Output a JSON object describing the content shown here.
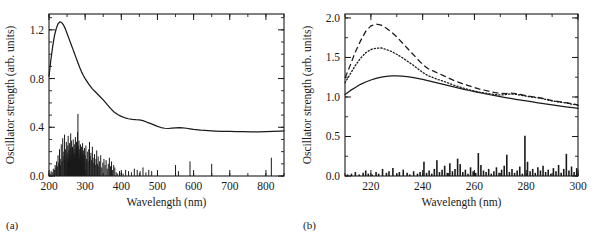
{
  "figure": {
    "panel_a_label": "(a)",
    "panel_b_label": "(b)"
  },
  "chart_data": [
    {
      "type": "line",
      "panel": "(a)",
      "title": "",
      "xlabel": "Wavelength (nm)",
      "ylabel": "Oscillator strength (arb. units)",
      "xlim": [
        200,
        850
      ],
      "ylim": [
        0.0,
        1.33
      ],
      "xticks": [
        200,
        300,
        400,
        500,
        600,
        700,
        800
      ],
      "xtick_labels": [
        "200",
        "300",
        "400",
        "500",
        "600",
        "700",
        "800"
      ],
      "yticks": [
        0.0,
        0.4,
        0.8,
        1.2
      ],
      "ytick_labels": [
        "0.0",
        "0.4",
        "0.8",
        "1.2"
      ],
      "minor_xtick_interval": 50,
      "minor_ytick_interval": 0.1,
      "grid": false,
      "legend": "none",
      "series": [
        {
          "name": "broadened spectrum",
          "style": "solid",
          "x": [
            200,
            205,
            210,
            215,
            220,
            225,
            230,
            235,
            240,
            245,
            250,
            255,
            260,
            265,
            270,
            275,
            280,
            285,
            290,
            295,
            300,
            310,
            320,
            330,
            340,
            350,
            360,
            370,
            380,
            390,
            400,
            410,
            420,
            430,
            440,
            450,
            460,
            470,
            480,
            490,
            500,
            510,
            520,
            530,
            540,
            550,
            560,
            570,
            580,
            590,
            600,
            620,
            640,
            660,
            680,
            700,
            720,
            740,
            760,
            780,
            800,
            820,
            840,
            850
          ],
          "y": [
            0.82,
            0.95,
            1.06,
            1.15,
            1.21,
            1.25,
            1.265,
            1.26,
            1.24,
            1.21,
            1.17,
            1.13,
            1.09,
            1.05,
            1.01,
            0.97,
            0.93,
            0.89,
            0.855,
            0.825,
            0.8,
            0.755,
            0.715,
            0.685,
            0.655,
            0.625,
            0.59,
            0.555,
            0.525,
            0.505,
            0.49,
            0.478,
            0.47,
            0.465,
            0.462,
            0.461,
            0.455,
            0.443,
            0.432,
            0.42,
            0.408,
            0.398,
            0.392,
            0.39,
            0.393,
            0.396,
            0.398,
            0.396,
            0.392,
            0.387,
            0.382,
            0.376,
            0.372,
            0.369,
            0.367,
            0.366,
            0.365,
            0.364,
            0.363,
            0.363,
            0.364,
            0.366,
            0.369,
            0.371
          ]
        }
      ],
      "stick_spectrum": {
        "name": "oscillator strength transitions",
        "x": [
          203,
          206,
          209,
          212,
          215,
          217,
          219,
          221,
          223,
          225,
          227,
          229,
          231,
          232,
          234,
          236,
          238,
          239,
          241,
          243,
          244,
          246,
          247,
          248,
          250,
          251,
          252,
          253,
          254,
          255,
          256,
          257,
          258,
          259,
          260,
          261,
          262,
          263,
          264,
          265,
          266,
          267,
          268,
          269,
          270,
          271,
          272,
          273,
          274,
          275,
          276,
          277,
          278,
          279,
          280,
          281,
          282,
          283,
          284,
          285,
          286,
          287,
          288,
          289,
          290,
          291,
          292,
          293,
          294,
          295,
          296,
          297,
          298,
          299,
          300,
          302,
          304,
          306,
          308,
          310,
          312,
          314,
          316,
          318,
          320,
          322,
          324,
          326,
          328,
          330,
          332,
          334,
          336,
          338,
          340,
          343,
          346,
          349,
          352,
          355,
          358,
          361,
          364,
          367,
          370,
          373,
          376,
          379,
          382,
          386,
          390,
          395,
          400,
          405,
          412,
          420,
          428,
          436,
          444,
          452,
          460,
          468,
          476,
          484,
          550,
          558,
          590,
          650,
          815
        ],
        "y": [
          0.02,
          0.04,
          0.03,
          0.06,
          0.05,
          0.09,
          0.07,
          0.12,
          0.08,
          0.17,
          0.11,
          0.22,
          0.14,
          0.09,
          0.26,
          0.12,
          0.31,
          0.16,
          0.2,
          0.34,
          0.13,
          0.22,
          0.16,
          0.28,
          0.19,
          0.12,
          0.25,
          0.33,
          0.15,
          0.21,
          0.18,
          0.27,
          0.14,
          0.23,
          0.35,
          0.17,
          0.29,
          0.13,
          0.2,
          0.24,
          0.16,
          0.3,
          0.18,
          0.22,
          0.26,
          0.14,
          0.19,
          0.32,
          0.17,
          0.23,
          0.28,
          0.15,
          0.21,
          0.36,
          0.51,
          0.25,
          0.18,
          0.29,
          0.14,
          0.22,
          0.17,
          0.26,
          0.13,
          0.2,
          0.24,
          0.16,
          0.19,
          0.27,
          0.12,
          0.21,
          0.15,
          0.18,
          0.23,
          0.11,
          0.17,
          0.25,
          0.14,
          0.2,
          0.12,
          0.22,
          0.28,
          0.16,
          0.19,
          0.13,
          0.24,
          0.15,
          0.11,
          0.18,
          0.09,
          0.14,
          0.21,
          0.1,
          0.16,
          0.08,
          0.12,
          0.17,
          0.07,
          0.11,
          0.14,
          0.09,
          0.13,
          0.06,
          0.1,
          0.15,
          0.08,
          0.12,
          0.05,
          0.09,
          0.07,
          0.03,
          0.02,
          0.04,
          0.03,
          0.02,
          0.05,
          0.04,
          0.03,
          0.06,
          0.05,
          0.04,
          0.07,
          0.03,
          0.05,
          0.04,
          0.09,
          0.04,
          0.12,
          0.1,
          0.15
        ]
      }
    },
    {
      "type": "line",
      "panel": "(b)",
      "title": "",
      "xlabel": "Wavelength (nm)",
      "ylabel": "Oscillator strength (arb. units)",
      "xlim": [
        210,
        300
      ],
      "ylim": [
        0.0,
        2.05
      ],
      "xticks": [
        220,
        240,
        260,
        280,
        300
      ],
      "xtick_labels": [
        "220",
        "240",
        "260",
        "280",
        "300"
      ],
      "yticks": [
        0.0,
        0.5,
        1.0,
        1.5,
        2.0
      ],
      "ytick_labels": [
        "0.0",
        "0.5",
        "1.0",
        "1.5",
        "2.0"
      ],
      "minor_xtick_interval": 10,
      "minor_ytick_interval": 0.25,
      "grid": false,
      "legend": "none",
      "series": [
        {
          "name": "dashed spectrum",
          "style": "dashed",
          "x": [
            210,
            212,
            214,
            216,
            218,
            220,
            222,
            224,
            226,
            228,
            230,
            232,
            234,
            236,
            238,
            240,
            242,
            244,
            246,
            248,
            250,
            252,
            254,
            256,
            258,
            260,
            262,
            264,
            266,
            268,
            270,
            272,
            274,
            276,
            278,
            280,
            282,
            284,
            286,
            288,
            290,
            292,
            294,
            296,
            298,
            300
          ],
          "y": [
            1.24,
            1.4,
            1.57,
            1.71,
            1.83,
            1.9,
            1.922,
            1.91,
            1.87,
            1.82,
            1.76,
            1.69,
            1.62,
            1.55,
            1.48,
            1.41,
            1.36,
            1.33,
            1.3,
            1.27,
            1.24,
            1.21,
            1.185,
            1.16,
            1.14,
            1.12,
            1.1,
            1.085,
            1.07,
            1.055,
            1.045,
            1.042,
            1.048,
            1.044,
            1.03,
            1.015,
            1.005,
            1.0,
            0.985,
            0.97,
            0.955,
            0.945,
            0.935,
            0.925,
            0.912,
            0.9
          ]
        },
        {
          "name": "dotted spectrum",
          "style": "dotted",
          "x": [
            210,
            212,
            214,
            216,
            218,
            220,
            222,
            224,
            226,
            228,
            230,
            232,
            234,
            236,
            238,
            240,
            242,
            244,
            246,
            248,
            250,
            252,
            254,
            256,
            258,
            260,
            262,
            264,
            266,
            268,
            270,
            272,
            274,
            276,
            278,
            280,
            282,
            284,
            286,
            288,
            290,
            292,
            294,
            296,
            298,
            300
          ],
          "y": [
            1.18,
            1.29,
            1.4,
            1.49,
            1.56,
            1.6,
            1.617,
            1.62,
            1.6,
            1.575,
            1.54,
            1.5,
            1.455,
            1.41,
            1.36,
            1.31,
            1.27,
            1.245,
            1.22,
            1.2,
            1.175,
            1.15,
            1.13,
            1.11,
            1.09,
            1.075,
            1.06,
            1.05,
            1.04,
            1.03,
            1.025,
            1.03,
            1.038,
            1.034,
            1.022,
            1.01,
            1.0,
            0.992,
            0.98,
            0.965,
            0.95,
            0.94,
            0.93,
            0.92,
            0.908,
            0.895
          ]
        },
        {
          "name": "solid spectrum",
          "style": "solid",
          "x": [
            210,
            212,
            214,
            216,
            218,
            220,
            222,
            224,
            226,
            228,
            230,
            232,
            234,
            236,
            238,
            240,
            242,
            244,
            246,
            248,
            250,
            252,
            254,
            256,
            258,
            260,
            262,
            264,
            266,
            268,
            270,
            272,
            274,
            276,
            278,
            280,
            282,
            284,
            286,
            288,
            290,
            292,
            294,
            296,
            298,
            300
          ],
          "y": [
            1.03,
            1.08,
            1.12,
            1.16,
            1.19,
            1.215,
            1.235,
            1.25,
            1.26,
            1.266,
            1.268,
            1.265,
            1.258,
            1.248,
            1.236,
            1.222,
            1.207,
            1.191,
            1.175,
            1.159,
            1.143,
            1.127,
            1.112,
            1.097,
            1.082,
            1.068,
            1.054,
            1.041,
            1.028,
            1.016,
            1.004,
            0.993,
            0.982,
            0.971,
            0.96,
            0.95,
            0.94,
            0.93,
            0.92,
            0.91,
            0.9,
            0.891,
            0.882,
            0.873,
            0.864,
            0.855
          ]
        }
      ],
      "stick_spectrum": {
        "name": "oscillator strength transitions",
        "x": [
          211,
          212.5,
          214,
          215.5,
          217,
          218,
          219,
          220.5,
          222,
          223,
          224.5,
          226,
          227,
          228.5,
          230,
          231,
          232.5,
          234,
          235,
          236.5,
          238,
          239,
          240.5,
          241.5,
          242.5,
          243.5,
          244.5,
          245.5,
          246.5,
          247.5,
          248.5,
          249.5,
          250.5,
          251.5,
          252.5,
          253.5,
          254.5,
          255.5,
          256.5,
          257.5,
          258.5,
          259.5,
          260.5,
          261.5,
          262.5,
          263.5,
          264.5,
          265.5,
          266.5,
          267.5,
          268.5,
          269.5,
          270.5,
          271.5,
          272.5,
          273.5,
          274.5,
          275.5,
          276.5,
          277.5,
          278.5,
          279.5,
          280.5,
          281.5,
          282.5,
          283.5,
          284.5,
          285.5,
          286.5,
          287.5,
          288.5,
          289.5,
          290.5,
          291.5,
          292.5,
          293.5,
          294.5,
          295.5,
          296.5,
          297.5,
          298.5,
          299.5
        ],
        "y": [
          0.02,
          0.03,
          0.05,
          0.02,
          0.04,
          0.07,
          0.03,
          0.02,
          0.05,
          0.03,
          0.09,
          0.04,
          0.06,
          0.1,
          0.03,
          0.05,
          0.08,
          0.04,
          0.02,
          0.06,
          0.03,
          0.05,
          0.18,
          0.04,
          0.07,
          0.03,
          0.09,
          0.2,
          0.05,
          0.08,
          0.13,
          0.04,
          0.16,
          0.06,
          0.09,
          0.22,
          0.15,
          0.05,
          0.08,
          0.03,
          0.11,
          0.06,
          0.04,
          0.29,
          0.14,
          0.07,
          0.05,
          0.09,
          0.03,
          0.06,
          0.11,
          0.04,
          0.08,
          0.13,
          0.27,
          0.05,
          0.09,
          0.04,
          0.07,
          0.12,
          0.03,
          0.51,
          0.18,
          0.06,
          0.09,
          0.04,
          0.11,
          0.07,
          0.13,
          0.05,
          0.08,
          0.03,
          0.1,
          0.06,
          0.14,
          0.04,
          0.09,
          0.28,
          0.07,
          0.12,
          0.05,
          0.1
        ]
      }
    }
  ]
}
